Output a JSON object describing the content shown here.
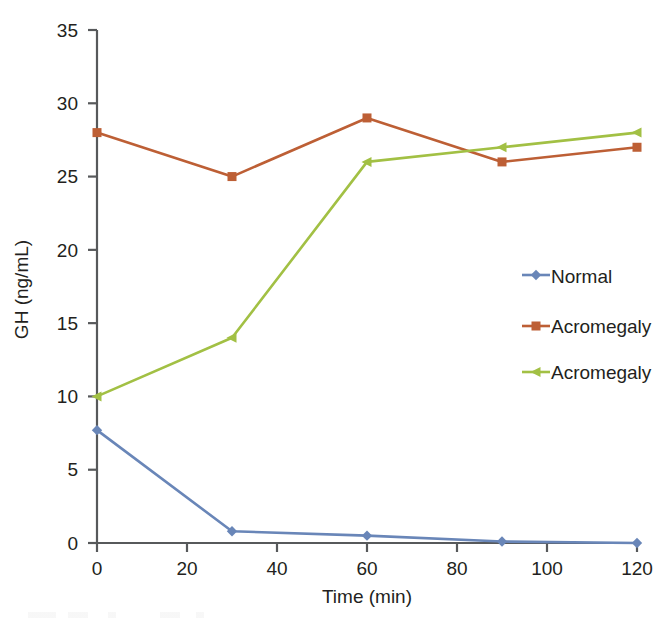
{
  "chart_data": {
    "type": "line",
    "title": "",
    "subtitle": "",
    "xlabel": "Time (min)",
    "ylabel": "GH (ng/mL)",
    "x": [
      0,
      30,
      60,
      90,
      120
    ],
    "xlim": [
      0,
      120
    ],
    "ylim": [
      0,
      35
    ],
    "xticks": [
      "0",
      "20",
      "40",
      "60",
      "80",
      "100",
      "120"
    ],
    "xtick_values": [
      0,
      20,
      40,
      60,
      80,
      100,
      120
    ],
    "yticks": [
      "0",
      "5",
      "10",
      "15",
      "20",
      "25",
      "30",
      "35"
    ],
    "ytick_values": [
      0,
      5,
      10,
      15,
      20,
      25,
      30,
      35
    ],
    "grid": false,
    "legend_position": "center-right",
    "series": [
      {
        "name": "Normal",
        "color": "#6986b8",
        "marker": "diamond",
        "values": [
          7.7,
          0.8,
          0.5,
          0.1,
          0.0
        ]
      },
      {
        "name": "Acromegaly",
        "color": "#bd5f35",
        "marker": "square",
        "values": [
          28,
          25,
          29,
          26,
          27
        ]
      },
      {
        "name": "Acromegaly",
        "color": "#a2c044",
        "marker": "triangle",
        "values": [
          10,
          14,
          26,
          27,
          28
        ]
      }
    ]
  },
  "legend": {
    "entries": [
      {
        "label": "Normal",
        "color": "#6986b8",
        "marker": "diamond-icon"
      },
      {
        "label": "Acromegaly",
        "color": "#bd5f35",
        "marker": "square-icon"
      },
      {
        "label": "Acromegaly",
        "color": "#a2c044",
        "marker": "triangle-icon"
      }
    ]
  },
  "axes": {
    "y_title": "GH (ng/mL)",
    "x_title": "Time (min)",
    "axis_color": "#57595b",
    "y_tick_labels": [
      "35",
      "30",
      "25",
      "20",
      "15",
      "10",
      "5",
      "0"
    ],
    "x_tick_labels": [
      "0",
      "20",
      "40",
      "60",
      "80",
      "100",
      "120"
    ]
  },
  "colors": {
    "normal": "#6986b8",
    "acromegaly_1": "#bd5f35",
    "acromegaly_2": "#a2c044",
    "axis": "#57595b",
    "text": "#231f20",
    "background": "#ffffff"
  }
}
